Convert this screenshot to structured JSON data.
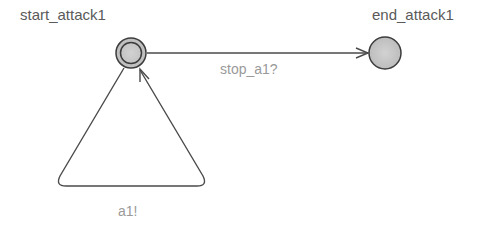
{
  "automaton": {
    "locations": [
      {
        "id": "start",
        "name": "start_attack1",
        "initial": true,
        "x": 131,
        "y": 53
      },
      {
        "id": "end",
        "name": "end_attack1",
        "initial": false,
        "x": 385,
        "y": 53
      }
    ],
    "edges": [
      {
        "id": "stop-edge",
        "from": "start_attack1",
        "to": "end_attack1",
        "sync": "stop_a1?"
      },
      {
        "id": "loop-edge",
        "from": "start_attack1",
        "to": "start_attack1",
        "sync": "a1!"
      }
    ]
  },
  "colors": {
    "node_fill": "#c8c8c8",
    "node_stroke": "#3c3c3c",
    "edge_stroke": "#4a4a4a",
    "location_label": "#5a5a5a",
    "edge_label": "#9a9a9a"
  }
}
